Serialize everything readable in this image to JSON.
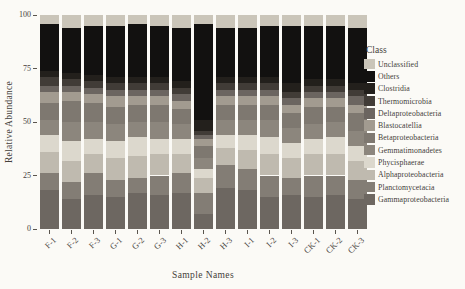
{
  "figure": {
    "background": "#fbfaf6",
    "text_color": "#44403a"
  },
  "chart_data": {
    "type": "bar",
    "stacked": true,
    "title": "",
    "xlabel": "Sample Names",
    "ylabel": "Relative Abundance",
    "ylim": [
      0,
      100
    ],
    "yticks": [
      0,
      25,
      50,
      75,
      100
    ],
    "grid": false,
    "legend_title": "Class",
    "legend_position": "right",
    "categories": [
      "F-1",
      "F-2",
      "F-3",
      "G-1",
      "G-2",
      "G-3",
      "H-1",
      "H-2",
      "H-3",
      "I-1",
      "I-2",
      "I-3",
      "CK-1",
      "CK-2",
      "CK-3"
    ],
    "series": [
      {
        "name": "Unclassified",
        "color": "#cac5b9",
        "values": [
          4,
          6,
          5,
          5,
          4,
          5,
          6,
          4,
          6,
          6,
          5,
          5,
          5,
          5,
          6
        ]
      },
      {
        "name": "Others",
        "color": "#121110",
        "values": [
          22,
          21,
          23,
          24,
          25,
          24,
          25,
          45,
          23,
          23,
          24,
          27,
          25,
          25,
          26
        ]
      },
      {
        "name": "Clostridia",
        "color": "#23201c",
        "values": [
          3,
          3,
          3,
          3,
          3,
          3,
          3,
          5,
          3,
          3,
          3,
          4,
          3,
          3,
          3
        ]
      },
      {
        "name": "Thermomicrobia",
        "color": "#413c37",
        "values": [
          4,
          3,
          3,
          3,
          3,
          3,
          3,
          2,
          3,
          3,
          3,
          3,
          3,
          3,
          3
        ]
      },
      {
        "name": "Deltaproteobacteria",
        "color": "#6b6560",
        "values": [
          3,
          3,
          3,
          3,
          3,
          3,
          3,
          2,
          3,
          3,
          3,
          3,
          3,
          3,
          4
        ]
      },
      {
        "name": "Blastocatellia",
        "color": "#a29b90",
        "values": [
          5,
          4,
          4,
          5,
          4,
          4,
          4,
          3,
          4,
          4,
          4,
          4,
          4,
          4,
          4
        ]
      },
      {
        "name": "Betaproteobacteria",
        "color": "#7e7870",
        "values": [
          8,
          10,
          9,
          8,
          8,
          8,
          7,
          6,
          7,
          7,
          7,
          7,
          8,
          7,
          8
        ]
      },
      {
        "name": "Gemmatimonadetes",
        "color": "#8c867d",
        "values": [
          7,
          9,
          8,
          8,
          7,
          8,
          7,
          5,
          7,
          7,
          8,
          7,
          7,
          7,
          7
        ]
      },
      {
        "name": "Phycisphaerae",
        "color": "#dcd8cd",
        "values": [
          8,
          9,
          7,
          8,
          9,
          7,
          7,
          4,
          6,
          7,
          8,
          7,
          7,
          8,
          7
        ]
      },
      {
        "name": "Alphaproteobacteria",
        "color": "#bfbaaf",
        "values": [
          10,
          10,
          9,
          10,
          10,
          10,
          9,
          7,
          8,
          9,
          10,
          9,
          10,
          10,
          9
        ]
      },
      {
        "name": "Planctomycetacia",
        "color": "#837d75",
        "values": [
          8,
          8,
          10,
          8,
          7,
          9,
          9,
          10,
          11,
          10,
          10,
          8,
          10,
          9,
          9
        ]
      },
      {
        "name": "Gammaproteobacteria",
        "color": "#6d6761",
        "values": [
          18,
          14,
          16,
          15,
          17,
          16,
          17,
          7,
          19,
          18,
          15,
          16,
          15,
          16,
          14
        ]
      }
    ]
  }
}
